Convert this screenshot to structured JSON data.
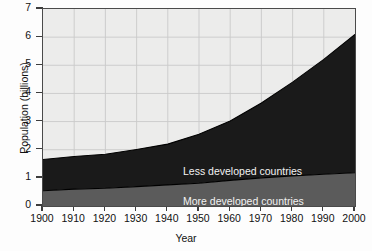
{
  "chart_data": {
    "type": "area",
    "stacked": true,
    "title": "",
    "subtitle": "",
    "xlabel": "Year",
    "ylabel": "Population (billions)",
    "xlim": [
      1900,
      2000
    ],
    "ylim": [
      0,
      7
    ],
    "xticks": [
      1900,
      1910,
      1920,
      1930,
      1940,
      1950,
      1960,
      1970,
      1980,
      1990,
      2000
    ],
    "xtick_labels": [
      "1900",
      "1910",
      "1920",
      "1930",
      "1940",
      "1950",
      "1960",
      "1970",
      "1980",
      "1990",
      "2000"
    ],
    "yticks": [
      0,
      1,
      2,
      3,
      4,
      5,
      6,
      7
    ],
    "ytick_labels": [
      "0",
      "1",
      "2",
      "3",
      "4",
      "5",
      "6",
      "7"
    ],
    "grid": true,
    "grid_color": "#c9c9c9",
    "plot_background": "#ececeb",
    "frame_color": "#4a4a4a",
    "legend_position": "in-plot-annotation",
    "x": [
      1900,
      1910,
      1920,
      1930,
      1940,
      1950,
      1960,
      1970,
      1980,
      1990,
      2000
    ],
    "series": [
      {
        "name": "More developed countries",
        "label": "More developed countries",
        "color": "#5b5b5b",
        "values": [
          0.54,
          0.6,
          0.63,
          0.69,
          0.75,
          0.81,
          0.91,
          1.0,
          1.07,
          1.13,
          1.18
        ]
      },
      {
        "name": "Less developed countries",
        "label": "Less developed countries",
        "color": "#1a1a1a",
        "values": [
          1.11,
          1.16,
          1.21,
          1.32,
          1.45,
          1.74,
          2.11,
          2.66,
          3.33,
          4.08,
          4.92
        ]
      }
    ],
    "totals": [
      1.65,
      1.76,
      1.84,
      2.01,
      2.2,
      2.55,
      3.02,
      3.66,
      4.4,
      5.21,
      6.1
    ],
    "annotations": [
      {
        "text": "Less developed countries",
        "x": 1945,
        "y": 1.75,
        "color": "#f2f2f2"
      },
      {
        "text": "More developed countries",
        "x": 1945,
        "y": 0.7,
        "color": "#f2f2f2"
      }
    ]
  }
}
